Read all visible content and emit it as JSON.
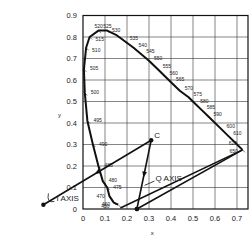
{
  "chart_data": {
    "type": "line",
    "title": "",
    "xlabel": "x",
    "ylabel": "y",
    "xlim": [
      0,
      0.75
    ],
    "ylim": [
      0,
      0.9
    ],
    "grid": true,
    "x_ticks": [
      "0",
      "0.1",
      "0.2",
      "0.3",
      "0.4",
      "0.5",
      "0.6",
      "0.7"
    ],
    "y_ticks": [
      "0",
      "0.1",
      "0.2",
      "0.3",
      "0.4",
      "0.5",
      "0.6",
      "0.7",
      "0.8",
      "0.9"
    ],
    "spectral_locus": [
      {
        "nm": "450",
        "x": 0.16,
        "y": 0.02
      },
      {
        "nm": "460",
        "x": 0.14,
        "y": 0.03
      },
      {
        "nm": "470",
        "x": 0.12,
        "y": 0.06
      },
      {
        "nm": "475",
        "x": 0.11,
        "y": 0.1
      },
      {
        "nm": "480",
        "x": 0.09,
        "y": 0.13
      },
      {
        "nm": "485",
        "x": 0.07,
        "y": 0.2
      },
      {
        "nm": "490",
        "x": 0.045,
        "y": 0.3
      },
      {
        "nm": "495",
        "x": 0.02,
        "y": 0.41
      },
      {
        "nm": "500",
        "x": 0.008,
        "y": 0.54
      },
      {
        "nm": "505",
        "x": 0.004,
        "y": 0.65
      },
      {
        "nm": "510",
        "x": 0.014,
        "y": 0.75
      },
      {
        "nm": "515",
        "x": 0.03,
        "y": 0.8
      },
      {
        "nm": "520",
        "x": 0.07,
        "y": 0.83
      },
      {
        "nm": "525",
        "x": 0.11,
        "y": 0.83
      },
      {
        "nm": "530",
        "x": 0.15,
        "y": 0.81
      },
      {
        "nm": "535",
        "x": 0.19,
        "y": 0.78
      },
      {
        "nm": "540",
        "x": 0.23,
        "y": 0.75
      },
      {
        "nm": "545",
        "x": 0.265,
        "y": 0.72
      },
      {
        "nm": "550",
        "x": 0.3,
        "y": 0.69
      },
      {
        "nm": "555",
        "x": 0.34,
        "y": 0.65
      },
      {
        "nm": "560",
        "x": 0.37,
        "y": 0.62
      },
      {
        "nm": "565",
        "x": 0.4,
        "y": 0.59
      },
      {
        "nm": "570",
        "x": 0.44,
        "y": 0.55
      },
      {
        "nm": "575",
        "x": 0.48,
        "y": 0.52
      },
      {
        "nm": "580",
        "x": 0.51,
        "y": 0.49
      },
      {
        "nm": "585",
        "x": 0.54,
        "y": 0.46
      },
      {
        "nm": "590",
        "x": 0.57,
        "y": 0.43
      },
      {
        "nm": "600",
        "x": 0.63,
        "y": 0.37
      },
      {
        "nm": "610",
        "x": 0.66,
        "y": 0.34
      },
      {
        "nm": "620",
        "x": 0.69,
        "y": 0.31
      },
      {
        "nm": "650",
        "x": 0.725,
        "y": 0.275
      }
    ],
    "purple_line": {
      "from": {
        "x": 0.17,
        "y": 0.005
      },
      "to": {
        "x": 0.725,
        "y": 0.275
      }
    },
    "points": [
      {
        "label": "C",
        "x": 0.31,
        "y": 0.32
      }
    ],
    "axes_annotations": [
      {
        "label": "I AXIS",
        "from": {
          "x": 0.31,
          "y": 0.32
        },
        "to": {
          "x": -0.18,
          "y": 0.02
        },
        "text_at": {
          "x": -0.12,
          "y": 0.035
        }
      },
      {
        "label": "Q AXIS",
        "from": {
          "x": 0.31,
          "y": 0.32
        },
        "to": {
          "x": 0.245,
          "y": 0.0
        },
        "text_at": {
          "x": 0.33,
          "y": 0.13
        }
      },
      {
        "label": "",
        "from": {
          "x": 0.725,
          "y": 0.275
        },
        "to": {
          "x": 0.245,
          "y": 0.0
        }
      }
    ]
  }
}
